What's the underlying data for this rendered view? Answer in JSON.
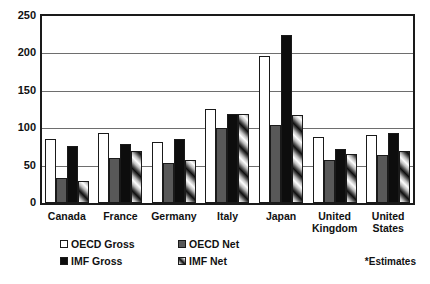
{
  "chart_data": {
    "type": "bar",
    "title": "",
    "xlabel": "",
    "ylabel": "",
    "ylim": [
      0,
      250
    ],
    "yticks": [
      0,
      50,
      100,
      150,
      200,
      250
    ],
    "grid": true,
    "legend_position": "bottom-left",
    "categories": [
      "Canada",
      "France",
      "Germany",
      "Italy",
      "Japan",
      "United Kingdom",
      "United States"
    ],
    "series": [
      {
        "name": "OECD Gross",
        "pattern": "white",
        "values": [
          85,
          93,
          82,
          126,
          196,
          88,
          91
        ]
      },
      {
        "name": "OECD Net",
        "pattern": "gray",
        "values": [
          33,
          60,
          53,
          100,
          104,
          58,
          64
        ]
      },
      {
        "name": "IMF Gross",
        "pattern": "black",
        "values": [
          76,
          79,
          86,
          119,
          225,
          72,
          94
        ]
      },
      {
        "name": "IMF Net",
        "pattern": "hatched",
        "values": [
          29,
          70,
          57,
          119,
          117,
          65,
          69
        ]
      }
    ],
    "annotations": [
      "*Estimates"
    ]
  },
  "footnote": "*Estimates"
}
